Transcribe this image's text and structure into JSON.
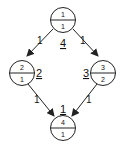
{
  "diagram": {
    "type": "directed-graph",
    "nodes": [
      {
        "id": "top",
        "top_value": "1",
        "bottom_value": "1",
        "label": "4"
      },
      {
        "id": "left",
        "top_value": "2",
        "bottom_value": "1",
        "label": "2"
      },
      {
        "id": "right",
        "top_value": "3",
        "bottom_value": "2",
        "label": "3"
      },
      {
        "id": "bottom",
        "top_value": "4",
        "bottom_value": "1",
        "label": "1"
      }
    ],
    "edges": [
      {
        "from": "top",
        "to": "left",
        "weight": "1"
      },
      {
        "from": "top",
        "to": "right",
        "weight": "1"
      },
      {
        "from": "left",
        "to": "bottom",
        "weight": "1"
      },
      {
        "from": "right",
        "to": "bottom",
        "weight": "1"
      }
    ],
    "colors": {
      "stroke": "#222222",
      "background": "#ffffff"
    }
  }
}
